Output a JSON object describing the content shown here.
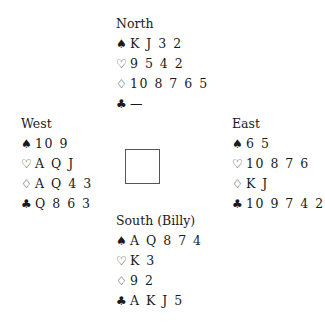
{
  "hands": {
    "north": {
      "label": "North",
      "spades": "K J 3 2",
      "hearts": "9 5 4 2",
      "diamonds": "10 8 7 6 5",
      "clubs": "—"
    },
    "west": {
      "label": "West",
      "spades": "10 9",
      "hearts": "A Q J",
      "diamonds": "A Q 4 3",
      "clubs": "Q 8 6 3"
    },
    "east": {
      "label": "East",
      "spades": "6 5",
      "hearts": "10 8 7 6",
      "diamonds": "K J",
      "clubs": "10 9 7 4 2"
    },
    "south": {
      "label": "South (Billy)",
      "spades": "A Q 8 7 4",
      "hearts": "K 3",
      "diamonds": "9 2",
      "clubs": "A K J 5"
    }
  },
  "suit_symbols": {
    "spades": "♠",
    "hearts": "♡",
    "diamonds": "♢",
    "clubs": "♣"
  }
}
